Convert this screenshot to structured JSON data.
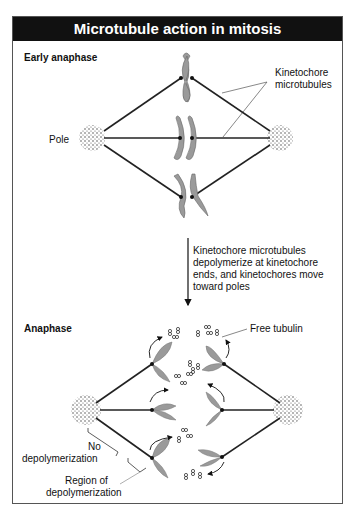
{
  "title": "Microtubule action in mitosis",
  "sections": {
    "early": {
      "label": "Early anaphase"
    },
    "late": {
      "label": "Anaphase"
    }
  },
  "labels": {
    "pole": "Pole",
    "kinetochore_mt_1": "Kinetochore",
    "kinetochore_mt_2": "microtubules",
    "arrow_text": [
      "Kinetochore microtubules",
      "depolymerize at kinetochore",
      "ends, and kinetochores move",
      "toward poles"
    ],
    "free_tubulin": "Free tubulin",
    "no_depol_1": "No",
    "no_depol_2": "depolymerization",
    "region_1": "Region of",
    "region_2": "depolymerization"
  },
  "colors": {
    "title_bg": "#111111",
    "chromosome": "#9a9a9a",
    "line": "#222222"
  }
}
